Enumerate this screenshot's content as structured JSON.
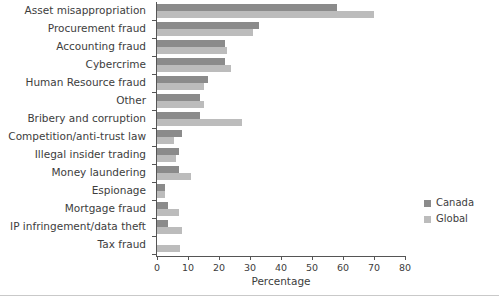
{
  "chart_data": {
    "type": "bar",
    "orientation": "horizontal",
    "title": "",
    "xlabel": "Percentage",
    "ylabel": "",
    "xlim": [
      0,
      80
    ],
    "xticks": [
      0,
      10,
      20,
      30,
      40,
      50,
      60,
      70,
      80
    ],
    "grid": false,
    "legend_position": "right",
    "categories": [
      "Asset misappropriation",
      "Procurement fraud",
      "Accounting fraud",
      "Cybercrime",
      "Human Resource fraud",
      "Other",
      "Bribery and corruption",
      "Competition/anti-trust law",
      "Illegal insider trading",
      "Money laundering",
      "Espionage",
      "Mortgage fraud",
      "IP infringement/data theft",
      "Tax fraud"
    ],
    "series": [
      {
        "name": "Canada",
        "color": "#8b8b8b",
        "values": [
          58,
          33,
          22,
          22,
          16.5,
          14,
          14,
          8,
          7,
          7,
          2.5,
          3.5,
          3.5,
          0
        ]
      },
      {
        "name": "Global",
        "color": "#bcbcbc",
        "values": [
          70,
          31,
          22.5,
          24,
          15,
          15,
          27.5,
          5.5,
          6,
          11,
          2.5,
          7,
          8,
          7.5
        ]
      }
    ]
  },
  "axis": {
    "x_title": "Percentage",
    "tick_labels": [
      "0",
      "10",
      "20",
      "30",
      "40",
      "50",
      "60",
      "70",
      "80"
    ]
  },
  "legend": {
    "items": [
      {
        "label": "Canada",
        "color": "#8b8b8b"
      },
      {
        "label": "Global",
        "color": "#bcbcbc"
      }
    ]
  }
}
